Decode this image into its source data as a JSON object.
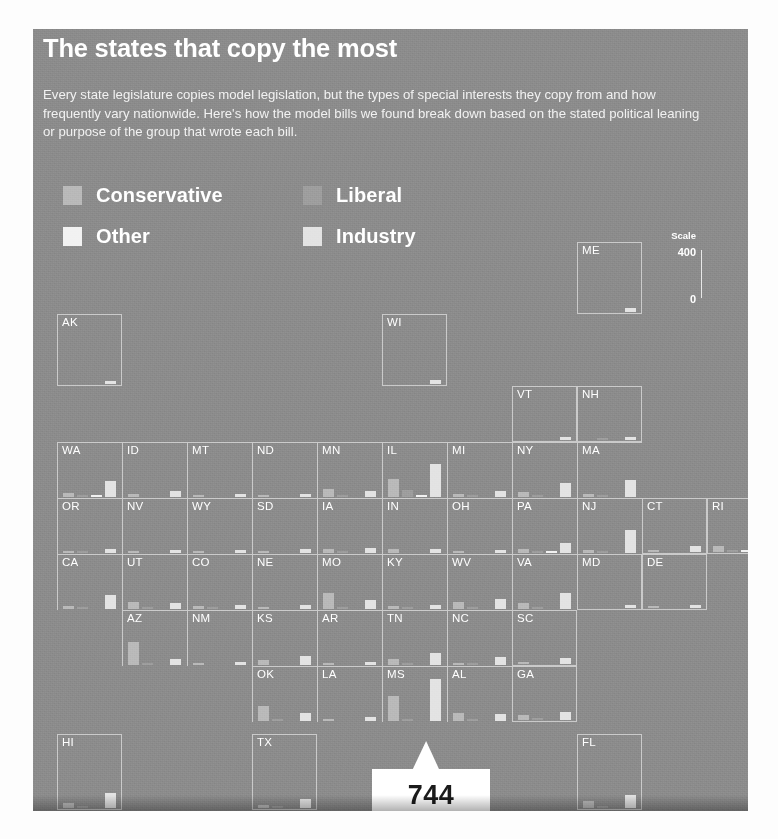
{
  "header": {
    "title": "The states that copy the most",
    "subtitle": "Every state legislature copies model legislation, but the types of special interests they copy from and how frequently vary nationwide. Here's how the model bills we found break down based on the stated political leaning or purpose of the group that wrote each bill."
  },
  "legend": {
    "items": [
      {
        "label": "Conservative",
        "color": "#b9b9b9"
      },
      {
        "label": "Liberal",
        "color": "#9d9d9d"
      },
      {
        "label": "Other",
        "color": "#f2f2f2"
      },
      {
        "label": "Industry",
        "color": "#e3e3e3"
      }
    ]
  },
  "scale": {
    "title": "Scale",
    "max_label": "400",
    "min_label": "0",
    "max_value": 400,
    "min_value": 0
  },
  "callout": {
    "value": "744",
    "points_to": "MS",
    "series": "Industry"
  },
  "chart_data": {
    "type": "bar",
    "title": "The states that copy the most",
    "subtitle": "Every state legislature copies model legislation, but the types of special interests they copy from and how frequently vary nationwide. Here's how the model bills we found break down based on the stated political leaning or purpose of the group that wrote each bill.",
    "layout": "small-multiples tile grid (cartogram of US states)",
    "categories": [
      "Conservative",
      "Liberal",
      "Other",
      "Industry"
    ],
    "series_colors": [
      "#b9b9b9",
      "#9d9d9d",
      "#f2f2f2",
      "#e3e3e3"
    ],
    "ylabel": "Model bills",
    "ylim": [
      0,
      400
    ],
    "grid": false,
    "legend_position": "top-left",
    "annotations": [
      {
        "text": "744",
        "state": "MS",
        "series": "Industry",
        "note": "value exceeds the 400 scale"
      }
    ],
    "states": [
      {
        "code": "AK",
        "row": 1,
        "col": 1,
        "values": [
          0,
          0,
          0,
          22
        ]
      },
      {
        "code": "WI",
        "row": 1,
        "col": 6,
        "values": [
          0,
          0,
          0,
          30
        ]
      },
      {
        "code": "VT",
        "row": 2,
        "col": 8,
        "values": [
          0,
          0,
          0,
          25
        ]
      },
      {
        "code": "NH",
        "row": 2,
        "col": 9,
        "values": [
          0,
          14,
          0,
          30
        ]
      },
      {
        "code": "ME",
        "row": 0,
        "col": 9,
        "values": [
          0,
          0,
          0,
          26
        ]
      },
      {
        "code": "WA",
        "row": 3,
        "col": 1,
        "values": [
          40,
          12,
          5,
          150
        ]
      },
      {
        "code": "ID",
        "row": 3,
        "col": 2,
        "values": [
          26,
          0,
          0,
          58
        ]
      },
      {
        "code": "MT",
        "row": 3,
        "col": 3,
        "values": [
          14,
          0,
          0,
          26
        ]
      },
      {
        "code": "ND",
        "row": 3,
        "col": 4,
        "values": [
          8,
          0,
          0,
          30
        ]
      },
      {
        "code": "MN",
        "row": 3,
        "col": 5,
        "values": [
          75,
          8,
          0,
          55
        ]
      },
      {
        "code": "IL",
        "row": 3,
        "col": 6,
        "values": [
          175,
          70,
          10,
          310
        ]
      },
      {
        "code": "MI",
        "row": 3,
        "col": 7,
        "values": [
          30,
          6,
          0,
          60
        ]
      },
      {
        "code": "NY",
        "row": 3,
        "col": 8,
        "values": [
          48,
          20,
          0,
          135
        ]
      },
      {
        "code": "MA",
        "row": 3,
        "col": 9,
        "values": [
          30,
          8,
          0,
          165
        ]
      },
      {
        "code": "OR",
        "row": 4,
        "col": 1,
        "values": [
          22,
          6,
          0,
          40
        ]
      },
      {
        "code": "NV",
        "row": 4,
        "col": 2,
        "values": [
          10,
          0,
          0,
          32
        ]
      },
      {
        "code": "WY",
        "row": 4,
        "col": 3,
        "values": [
          8,
          0,
          0,
          32
        ]
      },
      {
        "code": "SD",
        "row": 4,
        "col": 4,
        "values": [
          16,
          0,
          0,
          34
        ]
      },
      {
        "code": "IA",
        "row": 4,
        "col": 5,
        "values": [
          40,
          8,
          0,
          45
        ]
      },
      {
        "code": "IN",
        "row": 4,
        "col": 6,
        "values": [
          35,
          0,
          0,
          40
        ]
      },
      {
        "code": "OH",
        "row": 4,
        "col": 7,
        "values": [
          18,
          0,
          0,
          30
        ]
      },
      {
        "code": "PA",
        "row": 4,
        "col": 8,
        "values": [
          38,
          10,
          5,
          95
        ]
      },
      {
        "code": "NJ",
        "row": 4,
        "col": 9,
        "values": [
          28,
          8,
          0,
          215
        ]
      },
      {
        "code": "CT",
        "row": 4,
        "col": 10,
        "values": [
          20,
          0,
          0,
          62
        ]
      },
      {
        "code": "RI",
        "row": 4,
        "col": 11,
        "values": [
          55,
          14,
          8,
          110
        ]
      },
      {
        "code": "CA",
        "row": 5,
        "col": 1,
        "values": [
          30,
          10,
          0,
          130
        ]
      },
      {
        "code": "UT",
        "row": 5,
        "col": 2,
        "values": [
          70,
          6,
          0,
          62
        ]
      },
      {
        "code": "CO",
        "row": 5,
        "col": 3,
        "values": [
          24,
          6,
          0,
          34
        ]
      },
      {
        "code": "NE",
        "row": 5,
        "col": 4,
        "values": [
          18,
          0,
          0,
          38
        ]
      },
      {
        "code": "MO",
        "row": 5,
        "col": 5,
        "values": [
          150,
          10,
          0,
          85
        ]
      },
      {
        "code": "KY",
        "row": 5,
        "col": 6,
        "values": [
          30,
          6,
          0,
          42
        ]
      },
      {
        "code": "WV",
        "row": 5,
        "col": 7,
        "values": [
          70,
          6,
          0,
          95
        ]
      },
      {
        "code": "VA",
        "row": 5,
        "col": 8,
        "values": [
          60,
          10,
          0,
          155
        ]
      },
      {
        "code": "MD",
        "row": 5,
        "col": 9,
        "values": [
          0,
          0,
          0,
          28
        ]
      },
      {
        "code": "DE",
        "row": 5,
        "col": 10,
        "values": [
          14,
          0,
          0,
          30
        ]
      },
      {
        "code": "AZ",
        "row": 6,
        "col": 2,
        "values": [
          215,
          10,
          0,
          60
        ]
      },
      {
        "code": "NM",
        "row": 6,
        "col": 3,
        "values": [
          12,
          0,
          0,
          30
        ]
      },
      {
        "code": "KS",
        "row": 6,
        "col": 4,
        "values": [
          45,
          0,
          0,
          85
        ]
      },
      {
        "code": "AR",
        "row": 6,
        "col": 5,
        "values": [
          18,
          0,
          0,
          32
        ]
      },
      {
        "code": "TN",
        "row": 6,
        "col": 6,
        "values": [
          55,
          8,
          0,
          110
        ]
      },
      {
        "code": "NC",
        "row": 6,
        "col": 7,
        "values": [
          22,
          6,
          0,
          72
        ]
      },
      {
        "code": "SC",
        "row": 6,
        "col": 8,
        "values": [
          20,
          0,
          0,
          62
        ]
      },
      {
        "code": "OK",
        "row": 7,
        "col": 4,
        "values": [
          145,
          8,
          0,
          80
        ]
      },
      {
        "code": "LA",
        "row": 7,
        "col": 5,
        "values": [
          18,
          0,
          0,
          40
        ]
      },
      {
        "code": "MS",
        "row": 7,
        "col": 6,
        "values": [
          235,
          10,
          0,
          400
        ]
      },
      {
        "code": "AL",
        "row": 7,
        "col": 7,
        "values": [
          80,
          8,
          0,
          68
        ]
      },
      {
        "code": "GA",
        "row": 7,
        "col": 8,
        "values": [
          45,
          8,
          0,
          72
        ]
      },
      {
        "code": "HI",
        "row": 8,
        "col": 1,
        "values": [
          30,
          8,
          0,
          95
        ]
      },
      {
        "code": "TX",
        "row": 8,
        "col": 4,
        "values": [
          20,
          6,
          0,
          55
        ]
      },
      {
        "code": "FL",
        "row": 8,
        "col": 9,
        "values": [
          48,
          12,
          0,
          85
        ]
      }
    ]
  }
}
